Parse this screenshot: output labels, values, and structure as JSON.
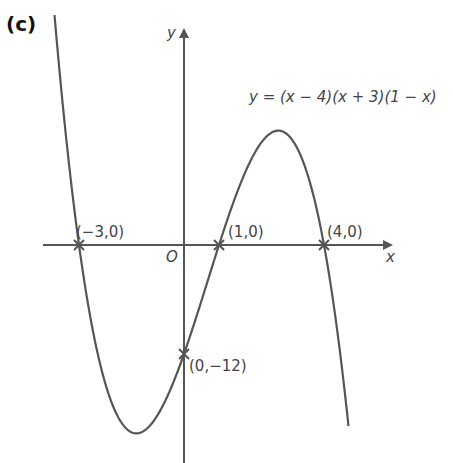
{
  "panel_label": "(c)",
  "chart_data": {
    "type": "line",
    "title": "",
    "function_label": "y = (x − 4)(x + 3)(1 − x)",
    "xlabel": "x",
    "ylabel": "y",
    "origin_label": "O",
    "grid": false,
    "legend": null,
    "xlim": [
      -3.9,
      6.0
    ],
    "ylim": [
      -24,
      24
    ],
    "series": [
      {
        "name": "y = (x - 4)(x + 3)(1 - x)",
        "expression": "(x-4)*(x+3)*(1-x)",
        "x_range": [
          -3.7,
          4.7
        ],
        "color": "#555555"
      }
    ],
    "marked_points": [
      {
        "x": -3,
        "y": 0,
        "label": "(−3,0)"
      },
      {
        "x": 1,
        "y": 0,
        "label": "(1,0)"
      },
      {
        "x": 4,
        "y": 0,
        "label": "(4,0)"
      },
      {
        "x": 0,
        "y": -12,
        "label": "(0,−12)"
      }
    ],
    "annotations": [
      "(−3,0)",
      "(1,0)",
      "(4,0)",
      "(0,−12)",
      "y = (x − 4)(x + 3)(1 − x)"
    ]
  },
  "colors": {
    "axis": "#555555",
    "curve": "#555555",
    "text": "#444444"
  }
}
